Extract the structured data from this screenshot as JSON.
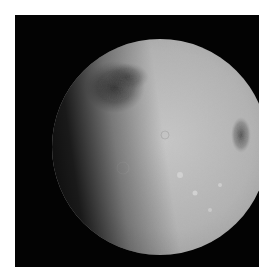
{
  "image": {
    "subject": "Moon",
    "phase": "gibbous",
    "colors": {
      "background": "#030303",
      "border": "#ffffff",
      "surface_light": "#c9c9c9",
      "surface_mid": "#9a9a9a",
      "mare_dark": "#4a4a4a"
    }
  }
}
